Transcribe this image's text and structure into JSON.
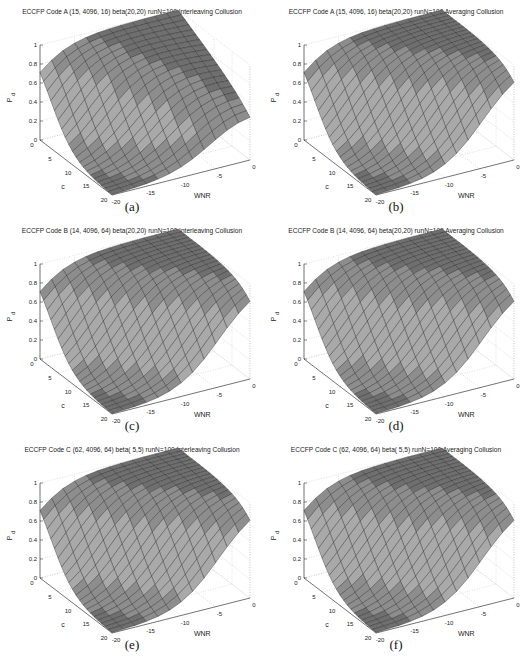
{
  "figure": {
    "panels": [
      {
        "id": "a",
        "caption": "(a)",
        "title": "ECCFP Code A (15, 4096, 16) beta(20,20) runN=100 Interleaving Collusion"
      },
      {
        "id": "b",
        "caption": "(b)",
        "title": "ECCFP Code A (15, 4096, 16) beta(20,20) runN=100 Averaging Collusion"
      },
      {
        "id": "c",
        "caption": "(c)",
        "title": "ECCFP Code B (14, 4096, 64) beta(20,20) runN=100 Interleaving Collusion"
      },
      {
        "id": "d",
        "caption": "(d)",
        "title": "ECCFP Code B (14, 4096, 64) beta(20,20) runN=100 Averaging Collusion"
      },
      {
        "id": "e",
        "caption": "(e)",
        "title": "ECCFP Code C (62, 4096, 64) beta( 5,5) runN=100 Interleaving Collusion"
      },
      {
        "id": "f",
        "caption": "(f)",
        "title": "ECCFP Code C (62, 4096, 64) beta( 5,5) runN=100 Averaging Collusion"
      }
    ],
    "axes": {
      "z_label": "P_d",
      "x_label": "c",
      "y_label": "WNR",
      "z_ticks": [
        "0",
        "0.2",
        "0.4",
        "0.6",
        "0.8",
        "1"
      ],
      "c_ticks": [
        "0",
        "5",
        "10",
        "15",
        "20"
      ],
      "wnr_ticks": [
        "-20",
        "-15",
        "-10",
        "-5",
        "0"
      ]
    },
    "colors": {
      "surface_light": "#a9a9a9",
      "surface_dark": "#6f6f6f",
      "edge": "#1e1e1e",
      "grid": "#bdbdbd"
    }
  },
  "chart_data": [
    {
      "type": "surface3d",
      "title": "ECCFP Code A (15, 4096, 16) beta(20,20) runN=100 Interleaving Collusion",
      "xlabel": "c",
      "ylabel": "WNR",
      "zlabel": "P_d",
      "xlim": [
        0,
        20
      ],
      "ylim": [
        -20,
        0
      ],
      "zlim": [
        0,
        1
      ],
      "grid": true,
      "description": "P_d ~1 for small c and high WNR; drops toward 0 as c increases and WNR decreases; plateau edge lower (~0.5) at c=20 near WNR 0"
    },
    {
      "type": "surface3d",
      "title": "ECCFP Code A (15, 4096, 16) beta(20,20) runN=100 Averaging Collusion",
      "xlabel": "c",
      "ylabel": "WNR",
      "zlabel": "P_d",
      "xlim": [
        0,
        20
      ],
      "ylim": [
        -20,
        0
      ],
      "zlim": [
        0,
        1
      ],
      "grid": true,
      "description": "P_d ~1 over most of high-WNR region; valley to 0 at large c and low WNR"
    },
    {
      "type": "surface3d",
      "title": "ECCFP Code B (14, 4096, 64) beta(20,20) runN=100 Interleaving Collusion",
      "xlabel": "c",
      "ylabel": "WNR",
      "zlabel": "P_d",
      "xlim": [
        0,
        20
      ],
      "ylim": [
        -20,
        0
      ],
      "zlim": [
        0,
        1
      ],
      "grid": true,
      "description": "P_d ~1 plateau; falls to 0 at c=20, WNR=-20"
    },
    {
      "type": "surface3d",
      "title": "ECCFP Code B (14, 4096, 64) beta(20,20) runN=100 Averaging Collusion",
      "xlabel": "c",
      "ylabel": "WNR",
      "zlabel": "P_d",
      "xlim": [
        0,
        20
      ],
      "ylim": [
        -20,
        0
      ],
      "zlim": [
        0,
        1
      ],
      "grid": true,
      "description": "P_d ~1 plateau; falls to 0 at large c, low WNR"
    },
    {
      "type": "surface3d",
      "title": "ECCFP Code C (62, 4096, 64) beta( 5,5) runN=100 Interleaving Collusion",
      "xlabel": "c",
      "ylabel": "WNR",
      "zlabel": "P_d",
      "xlim": [
        0,
        20
      ],
      "ylim": [
        -20,
        0
      ],
      "zlim": [
        0,
        1
      ],
      "grid": true,
      "description": "P_d ~1 plateau; falls to 0 at large c, low WNR"
    },
    {
      "type": "surface3d",
      "title": "ECCFP Code C (62, 4096, 64) beta( 5,5) runN=100 Averaging Collusion",
      "xlabel": "c",
      "ylabel": "WNR",
      "zlabel": "P_d",
      "xlim": [
        0,
        20
      ],
      "ylim": [
        -20,
        0
      ],
      "zlim": [
        0,
        1
      ],
      "grid": true,
      "description": "P_d ~1 plateau; falls to 0 at large c, low WNR"
    }
  ]
}
